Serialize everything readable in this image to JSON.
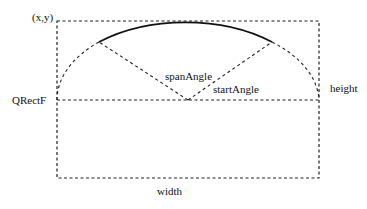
{
  "diagram": {
    "type": "qt-arc-geometry",
    "labels": {
      "origin": "(x,y)",
      "rect": "QRectF",
      "height": "height",
      "width": "width",
      "span_angle": "spanAngle",
      "start_angle": "startAngle"
    },
    "rect": {
      "left": 57,
      "top": 21,
      "right": 319,
      "bottom": 178
    },
    "ellipse": {
      "cx": 188,
      "cy": 100,
      "rx": 131,
      "ry": 79
    },
    "arc": {
      "start": [
        272,
        42
      ],
      "end": [
        99,
        42
      ]
    },
    "colors": {
      "stroke": "#222222",
      "text": "#111111",
      "background": "#ffffff"
    }
  }
}
